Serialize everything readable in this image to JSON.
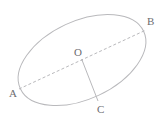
{
  "figure": {
    "name": "ellipse-with-center-and-chords",
    "caption_fragment": "",
    "background_color": "#ffffff",
    "stroke_color": "#b9b9bc",
    "label_color": "#6d6d70",
    "points": [
      {
        "id": "A",
        "label": "A",
        "x": 19,
        "y": 89
      },
      {
        "id": "B",
        "label": "B",
        "x": 146,
        "y": 30
      },
      {
        "id": "O",
        "label": "O",
        "x": 82,
        "y": 60
      },
      {
        "id": "C",
        "label": "C",
        "x": 98,
        "y": 101
      }
    ],
    "segments": [
      {
        "id": "AB",
        "from": "A",
        "to": "B",
        "style": "dashed"
      },
      {
        "id": "OC",
        "from": "O",
        "to": "C",
        "style": "solid"
      }
    ],
    "ellipse": {
      "center_x": 82,
      "center_y": 60,
      "radius_x": 68,
      "radius_y": 39,
      "rotation_deg": -25
    }
  }
}
